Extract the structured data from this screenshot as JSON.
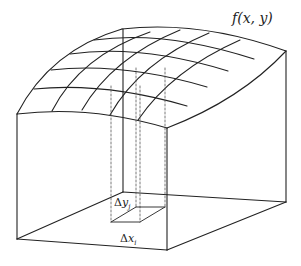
{
  "diagram": {
    "labels": {
      "surface": "f(x, y)",
      "delta_y_symbol": "Δ",
      "delta_y_var": "y",
      "delta_y_sub": "j",
      "delta_x_symbol": "Δ",
      "delta_x_var": "x",
      "delta_x_sub": "i"
    },
    "colors": {
      "line": "#222222",
      "dashed": "#555555",
      "background": "#ffffff"
    }
  }
}
